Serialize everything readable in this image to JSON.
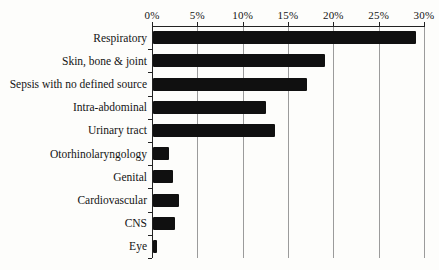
{
  "chart_data": {
    "type": "bar",
    "orientation": "horizontal",
    "title": "",
    "xlabel": "",
    "ylabel": "",
    "unit": "%",
    "categories": [
      "Respiratory",
      "Skin, bone & joint",
      "Sepsis with no defined source",
      "Intra-abdominal",
      "Urinary tract",
      "Otorhinolaryngology",
      "Genital",
      "Cardiovascular",
      "CNS",
      "Eye"
    ],
    "values": [
      29,
      19,
      17,
      12.5,
      13.5,
      1.8,
      2.2,
      2.9,
      2.4,
      0.4
    ],
    "xlim": [
      0,
      30
    ],
    "x_tick_labels": [
      "0%",
      "5%",
      "10%",
      "15%",
      "20%",
      "25%",
      "30%"
    ],
    "x_tick_values": [
      0,
      5,
      10,
      15,
      20,
      25,
      30
    ],
    "grid": true,
    "legend": "none",
    "colors": {
      "bar": "#101010",
      "gridline": "#9b9b9b",
      "axis": "#222222",
      "text": "#141414",
      "background": "#fdfdfb"
    }
  }
}
